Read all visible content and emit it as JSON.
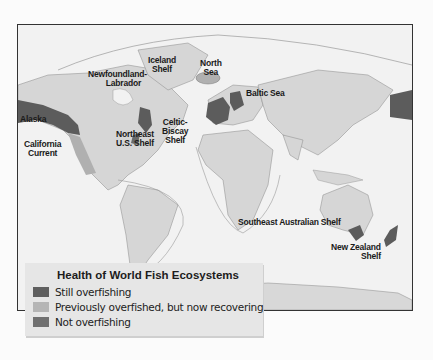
{
  "colors": {
    "still_overfishing": "#5c5c5c",
    "recovering": "#b3b3b3",
    "not_overfishing": "#6e6e6e",
    "land": "#d6d6d6",
    "ocean": "#f2f2f2",
    "shelf_line": "#9a9a9a"
  },
  "map": {
    "labels": {
      "alaska": "Alaska",
      "california_current_1": "California",
      "california_current_2": "Current",
      "newfoundland_1": "Newfoundland-",
      "newfoundland_2": "Labrador",
      "iceland_1": "Iceland",
      "iceland_2": "Shelf",
      "north_sea_1": "North",
      "north_sea_2": "Sea",
      "baltic": "Baltic Sea",
      "celtic_1": "Celtic-",
      "celtic_2": "Biscay",
      "celtic_3": "Shelf",
      "northeast_us_1": "Northeast",
      "northeast_us_2": "U.S. Shelf",
      "se_australia": "Southeast Australian Shelf",
      "nz_1": "New Zealand",
      "nz_2": "Shelf"
    }
  },
  "legend": {
    "title": "Health of World Fish Ecosystems",
    "items": [
      {
        "label": "Still overfishing",
        "color": "#5f5f5f"
      },
      {
        "label": "Previously overfished, but now recovering",
        "color": "#b5b5b5"
      },
      {
        "label": "Not overfishing",
        "color": "#707070"
      }
    ]
  }
}
